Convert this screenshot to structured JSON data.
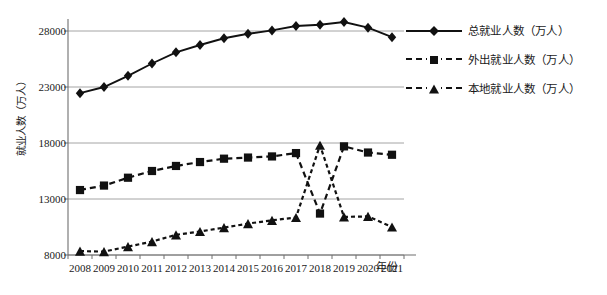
{
  "chart_data": {
    "type": "line",
    "title": "",
    "xlabel": "年份",
    "ylabel": "就业人数（万人）",
    "categories": [
      "2008",
      "2009",
      "2010",
      "2011",
      "2012",
      "2013",
      "2014",
      "2015",
      "2016",
      "2017",
      "2018",
      "2019",
      "2020",
      "2021"
    ],
    "ylim": [
      8000,
      28000
    ],
    "yticks": [
      8000,
      13000,
      18000,
      23000,
      28000
    ],
    "grid": true,
    "legend_position": "right",
    "series": [
      {
        "name": "总就业人数（万人）",
        "marker": "diamond",
        "linestyle": "solid",
        "color": "#111111",
        "values": [
          22450,
          23000,
          24000,
          25100,
          26100,
          26750,
          27350,
          27750,
          28050,
          28450,
          28550,
          28800,
          28300,
          27450
        ]
      },
      {
        "name": "外出就业人数（万人）",
        "marker": "square",
        "linestyle": "dashed",
        "color": "#111111",
        "values": [
          13800,
          14200,
          14900,
          15500,
          15950,
          16300,
          16600,
          16700,
          16800,
          17100,
          11700,
          17700,
          17150,
          16950
        ]
      },
      {
        "name": "本地就业人数（万人）",
        "marker": "triangle",
        "linestyle": "dashed",
        "color": "#111111",
        "values": [
          8350,
          8300,
          8750,
          9200,
          9800,
          10100,
          10450,
          10800,
          11100,
          11350,
          17800,
          11400,
          11450,
          10500
        ]
      }
    ]
  }
}
